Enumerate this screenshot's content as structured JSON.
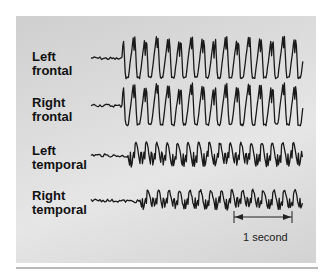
{
  "figure": {
    "title": "",
    "channels": [
      {
        "id": "left-frontal",
        "label": "Left\nfrontal",
        "baseline_y": 58,
        "amplitude": 22,
        "onset_x": 122,
        "style": "spike-wave-large"
      },
      {
        "id": "right-frontal",
        "label": "Right\nfrontal",
        "baseline_y": 105,
        "amplitude": 22,
        "onset_x": 122,
        "style": "spike-wave-large"
      },
      {
        "id": "left-temporal",
        "label": "Left\ntemporal",
        "baseline_y": 155,
        "amplitude": 15,
        "onset_x": 128,
        "style": "spike-wave-medium"
      },
      {
        "id": "right-temporal",
        "label": "Right\ntemporal",
        "baseline_y": 200,
        "amplitude": 12,
        "onset_x": 140,
        "style": "spike-wave-small"
      }
    ],
    "trace_start_x": 91,
    "trace_end_x": 303,
    "scale_bar": {
      "label": "1 second",
      "x1": 234,
      "x2": 292,
      "y": 217
    }
  },
  "colors": {
    "trace": "#1a1a1a",
    "panel_bg": "#dadada",
    "rule": "#b9b9b9"
  }
}
